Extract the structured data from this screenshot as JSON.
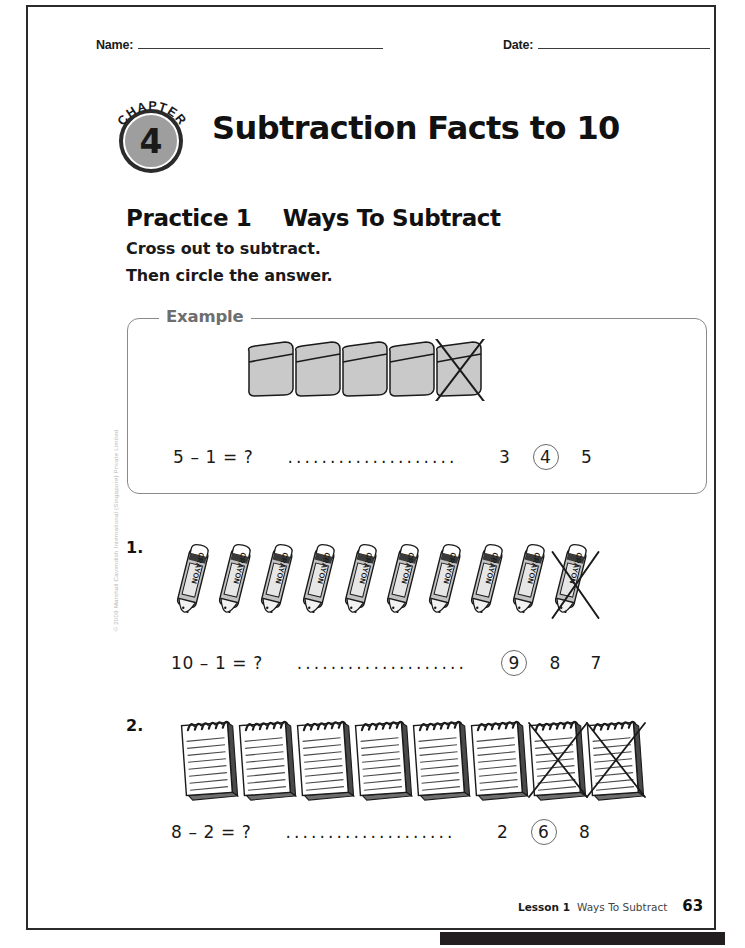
{
  "page": {
    "number": "63",
    "copyright": "© 2009 Marshall Cavendish International (Singapore) Private Limited"
  },
  "header": {
    "name_label": "Name:",
    "date_label": "Date:"
  },
  "chapter": {
    "word": "CHAPTER",
    "number": "4",
    "title": "Subtraction Facts to 10"
  },
  "practice": {
    "label": "Practice 1",
    "title": "Ways To Subtract",
    "instruction_1": "Cross out to subtract.",
    "instruction_2": "Then circle the answer."
  },
  "example": {
    "label": "Example",
    "equation": "5 – 1 = ?",
    "dots": "....................",
    "item": "eraser",
    "total_items": 5,
    "crossed_items": 1,
    "choices": [
      {
        "value": "3",
        "circled": false
      },
      {
        "value": "4",
        "circled": true
      },
      {
        "value": "5",
        "circled": false
      }
    ]
  },
  "questions": [
    {
      "number": "1.",
      "equation": "10 – 1 = ?",
      "dots": "....................",
      "item": "crayon",
      "item_label": "CRAYON",
      "total_items": 10,
      "crossed_items": 1,
      "choices": [
        {
          "value": "9",
          "circled": true
        },
        {
          "value": "8",
          "circled": false
        },
        {
          "value": "7",
          "circled": false
        }
      ]
    },
    {
      "number": "2.",
      "equation": "8 – 2 = ?",
      "dots": "....................",
      "item": "notepad",
      "total_items": 8,
      "crossed_items": 2,
      "choices": [
        {
          "value": "2",
          "circled": false
        },
        {
          "value": "6",
          "circled": true
        },
        {
          "value": "8",
          "circled": false
        }
      ]
    }
  ],
  "footer": {
    "lesson": "Lesson 1",
    "title": "Ways To Subtract",
    "page": "63"
  },
  "colors": {
    "ink": "#1a1a1a",
    "border": "#2b2b2b",
    "example_frame": "#8a8a8a",
    "example_label": "#6e6e6e",
    "badge_fill": "#9e9e9e",
    "art_fill": "#c9c9c9"
  }
}
